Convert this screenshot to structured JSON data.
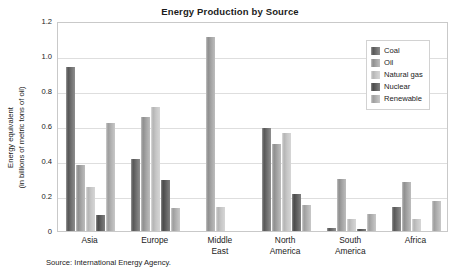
{
  "chart_data": {
    "type": "bar",
    "title": "Energy Production by Source",
    "xlabel": "",
    "ylabel": "Energy equivalent (in billions of metric tons of oil)",
    "ylabel_lines": [
      "Energy equivalent",
      "(in billions of metric tons of oil)"
    ],
    "ylim": [
      0,
      1.2
    ],
    "yticks": [
      "0",
      "0.2",
      "0.4",
      "0.6",
      "0.8",
      "1.0",
      "1.2"
    ],
    "ytick_values": [
      0,
      0.2,
      0.4,
      0.6,
      0.8,
      1.0,
      1.2
    ],
    "grid": true,
    "legend_position": "top-right",
    "categories": [
      "Asia",
      "Europe",
      "Middle East",
      "North America",
      "South America",
      "Africa"
    ],
    "category_lines": [
      [
        "Asia"
      ],
      [
        "Europe"
      ],
      [
        "Middle",
        "East"
      ],
      [
        "North",
        "America"
      ],
      [
        "South",
        "America"
      ],
      [
        "Africa"
      ]
    ],
    "series": [
      {
        "name": "Coal",
        "color": "#6e6e6e",
        "values": [
          0.94,
          0.41,
          0.0,
          0.59,
          0.02,
          0.14
        ]
      },
      {
        "name": "Oil",
        "color": "#a3a3a3",
        "values": [
          0.38,
          0.65,
          1.11,
          0.5,
          0.3,
          0.28
        ]
      },
      {
        "name": "Natural gas",
        "color": "#c6c6c6",
        "values": [
          0.25,
          0.71,
          0.14,
          0.56,
          0.07,
          0.07
        ]
      },
      {
        "name": "Nuclear",
        "color": "#606060",
        "values": [
          0.09,
          0.29,
          0.0,
          0.21,
          0.01,
          0.0
        ]
      },
      {
        "name": "Renewable",
        "color": "#b0b0b0",
        "values": [
          0.62,
          0.13,
          0.0,
          0.15,
          0.1,
          0.17
        ]
      }
    ]
  },
  "source_note": "Source: International Energy Agency."
}
